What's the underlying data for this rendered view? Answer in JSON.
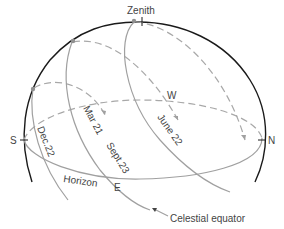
{
  "diagram": {
    "labels": {
      "zenith": "Zenith",
      "south": "S",
      "north": "N",
      "east": "E",
      "west": "W",
      "horizon": "Horizon",
      "dec22": "Dec.22",
      "mar21": "Mar 21",
      "sept23": "Sept.23",
      "june22": "June 22",
      "celestial_equator": "Celestial equator"
    },
    "colors": {
      "sphere_outline": "#1a1a1a",
      "path_lines": "#a0a0a0",
      "sun_marker": "#909090",
      "text": "#444444"
    }
  }
}
